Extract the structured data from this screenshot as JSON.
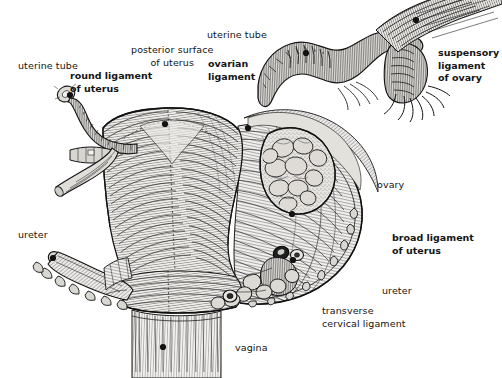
{
  "figure": {
    "background_color": "#ffffff",
    "ink_color": "#1c1c1c",
    "width": 502,
    "height": 378
  },
  "labels": [
    {
      "id": "uterine-tube-left",
      "text": "uterine tube",
      "bold": false,
      "align": "left",
      "x": 18,
      "y": 60,
      "dot": {
        "x": 70,
        "y": 95
      },
      "leader": [
        [
          84,
          70
        ],
        [
          71,
          93
        ]
      ]
    },
    {
      "id": "round-ligament-of-uterus",
      "text": "round ligament\nof uterus",
      "bold": true,
      "align": "left",
      "x": 70,
      "y": 70,
      "dot": null,
      "leader": [
        [
          110,
          97
        ],
        [
          131,
          128
        ]
      ]
    },
    {
      "id": "posterior-surface-of-uterus",
      "text": "posterior surface\nof uterus",
      "bold": false,
      "align": "center",
      "x": 131,
      "y": 44,
      "dot": {
        "x": 165,
        "y": 124
      },
      "leader": [
        [
          165,
          70
        ],
        [
          165,
          121
        ]
      ]
    },
    {
      "id": "ovarian-ligament",
      "text": "ovarian\nligament",
      "bold": true,
      "align": "left",
      "x": 208,
      "y": 58,
      "dot": {
        "x": 248,
        "y": 128
      },
      "leader": [
        [
          225,
          86
        ],
        [
          246,
          125
        ]
      ]
    },
    {
      "id": "uterine-tube-top",
      "text": "uterine tube",
      "bold": false,
      "align": "left",
      "x": 207,
      "y": 29,
      "dot": {
        "x": 306,
        "y": 53
      },
      "leader": [
        [
          265,
          37
        ],
        [
          303,
          51
        ]
      ]
    },
    {
      "id": "suspensory-ligament-of-ovary",
      "text": "suspensory\nligament\nof ovary",
      "bold": true,
      "align": "left",
      "x": 438,
      "y": 47,
      "dot": {
        "x": 416,
        "y": 20
      },
      "leader": [
        [
          418,
          23
        ],
        [
          436,
          48
        ]
      ]
    },
    {
      "id": "ovary",
      "text": "ovary",
      "bold": false,
      "align": "left",
      "x": 377,
      "y": 179,
      "dot": null,
      "leader": [
        [
          373,
          185
        ],
        [
          310,
          175
        ]
      ]
    },
    {
      "id": "broad-ligament-of-uterus",
      "text": "broad ligament\nof uterus",
      "bold": true,
      "align": "left",
      "x": 392,
      "y": 232,
      "dot": {
        "x": 292,
        "y": 214
      },
      "leader": [
        [
          388,
          239
        ],
        [
          295,
          216
        ]
      ]
    },
    {
      "id": "ureter-left",
      "text": "ureter",
      "bold": false,
      "align": "left",
      "x": 18,
      "y": 229,
      "dot": {
        "x": 53,
        "y": 258
      },
      "leader": [
        [
          32,
          240
        ],
        [
          51,
          256
        ]
      ]
    },
    {
      "id": "ureter-right",
      "text": "ureter",
      "bold": false,
      "align": "left",
      "x": 382,
      "y": 285,
      "dot": {
        "x": 293,
        "y": 260
      },
      "leader": [
        [
          378,
          290
        ],
        [
          300,
          266
        ]
      ]
    },
    {
      "id": "transverse-cervical-ligament",
      "text": "transverse\ncervical ligament",
      "bold": false,
      "align": "left",
      "x": 322,
      "y": 305,
      "dot": null,
      "leader": [
        [
          318,
          311
        ],
        [
          246,
          299
        ]
      ]
    },
    {
      "id": "vagina",
      "text": "vagina",
      "bold": false,
      "align": "left",
      "x": 235,
      "y": 342,
      "dot": {
        "x": 163,
        "y": 347
      },
      "leader": [
        [
          231,
          347
        ],
        [
          168,
          347
        ]
      ]
    }
  ]
}
